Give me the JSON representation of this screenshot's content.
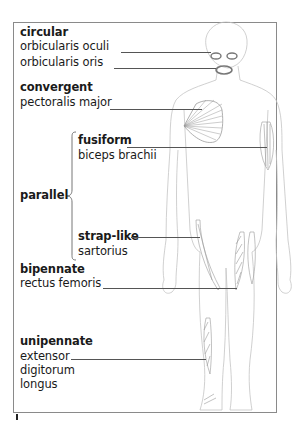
{
  "diagram": {
    "groups": [
      {
        "type": "circular",
        "muscles": [
          "orbicularis oculi",
          "orbicularis oris"
        ]
      },
      {
        "type": "convergent",
        "muscles": [
          "pectoralis major"
        ]
      },
      {
        "type": "parallel",
        "subtypes": [
          {
            "type": "fusiform",
            "muscles": [
              "biceps brachii"
            ]
          },
          {
            "type": "strap-like",
            "muscles": [
              "sartorius"
            ]
          }
        ]
      },
      {
        "type": "bipennate",
        "muscles": [
          "rectus femoris"
        ]
      },
      {
        "type": "unipennate",
        "muscles": [
          "extensor digitorum longus"
        ]
      }
    ]
  },
  "labels": {
    "circular": "circular",
    "orbicularis_oculi": "orbicularis oculi",
    "orbicularis_oris": "orbicularis oris",
    "convergent": "convergent",
    "pectoralis_major": "pectoralis major",
    "parallel": "parallel",
    "fusiform": "fusiform",
    "biceps_brachii": "biceps brachii",
    "strap_like": "strap-like",
    "sartorius": "sartorius",
    "bipennate": "bipennate",
    "rectus_femoris": "rectus femoris",
    "unipennate": "unipennate",
    "extensor": "extensor",
    "digitorum": "digitorum",
    "longus": "longus"
  },
  "colors": {
    "text": "#1a1a1a",
    "outline": "#bdbdbd",
    "muscle": "#9a9a9a",
    "leader": "#555555",
    "frame": "#8a8a8a"
  }
}
